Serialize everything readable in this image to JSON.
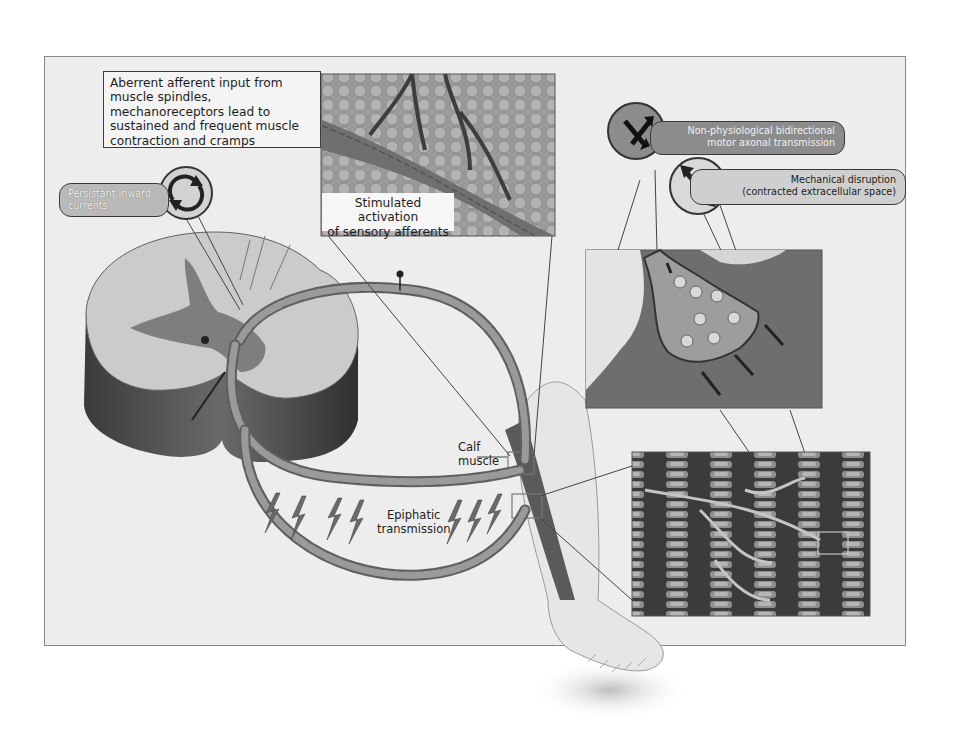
{
  "figure": {
    "palette": {
      "background": "#ffffff",
      "panel": "#ededed",
      "frame_border": "#8a8a8a",
      "white_matter": "#c9c9c9",
      "gray_matter": "#7c7c7c",
      "cord_side": "#4a4a4a",
      "axon": "#8e8e8e",
      "text": "#1e1e1e"
    }
  },
  "labels": {
    "aberrant_input": "Aberrent afferent input from muscle spindles, mechanoreceptors lead to sustained and frequent muscle contraction and cramps",
    "persistent_inward": "Persistant Inward currents",
    "stimulated_activation_line1": "Stimulated activation",
    "stimulated_activation_line2": "of sensory afferents",
    "non_physiological_line1": "Non-physiological bidirectional",
    "non_physiological_line2": "motor axonal transmission",
    "mechanical_line1": "Mechanical disruption",
    "mechanical_line2": "(contracted extracellular space)",
    "calf_line1": "Calf",
    "calf_line2": "muscle",
    "epiphatic_line1": "Epiphatic",
    "epiphatic_line2": "transmission"
  },
  "icons": {
    "cycle": "circular-arrows-icon",
    "bidirectional": "opposing-arrows-icon",
    "double_arrow": "double-headed-arrow-icon",
    "lightning": "lightning-bolt-icon"
  },
  "insets": [
    {
      "name": "muscle-spindle-inset",
      "caption_ref": "labels.stimulated_activation_line1"
    },
    {
      "name": "neuromuscular-junction-inset",
      "caption_ref": "labels.mechanical_line1"
    },
    {
      "name": "muscle-fibre-inset",
      "caption_ref": "labels.non_physiological_line1"
    }
  ]
}
